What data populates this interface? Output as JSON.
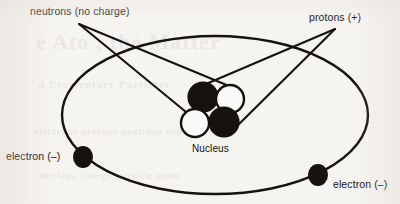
{
  "diagram": {
    "labels": {
      "neutrons": "neutrons (no charge)",
      "protons": "protons (+)",
      "electron_left": "electron (–)",
      "electron_right": "electron (–)",
      "nucleus": "Nucleus"
    },
    "ghost_text": {
      "title": "e Ato  ,  the Matter",
      "subtitle": "d Erementary Partictes",
      "body": "electrons protons neutrons orbit",
      "body2": "nucleus charge particle atom"
    },
    "colors": {
      "background": "#f6f4f1",
      "ink": "#15120f",
      "proton_fill": "#15120f",
      "neutron_fill": "#fbfaf8",
      "electron_fill": "#15120f",
      "orbit_stroke": "#15120f"
    },
    "particles": {
      "protons": [
        {
          "name": "proton-1",
          "cx": 203,
          "cy": 97,
          "r": 14.5,
          "fill": "#15120f"
        },
        {
          "name": "proton-2",
          "cx": 224,
          "cy": 122,
          "r": 14.5,
          "fill": "#15120f"
        }
      ],
      "neutrons": [
        {
          "name": "neutron-1",
          "cx": 230,
          "cy": 99,
          "r": 14.0,
          "fill": "#fbfaf8"
        },
        {
          "name": "neutron-2",
          "cx": 195,
          "cy": 123,
          "r": 14.0,
          "fill": "#fbfaf8"
        }
      ],
      "electrons": [
        {
          "name": "electron-left",
          "cx": 83,
          "cy": 157,
          "rx": 10,
          "ry": 11
        },
        {
          "name": "electron-right",
          "cx": 318,
          "cy": 175,
          "rx": 10,
          "ry": 11
        }
      ]
    },
    "orbit": {
      "cx": 215,
      "cy": 115,
      "rx": 153,
      "ry": 79,
      "stroke_width": 2.4
    },
    "leaders": {
      "neutron_origin": {
        "x": 79,
        "y": 24
      },
      "proton_origin": {
        "x": 335,
        "y": 29
      }
    }
  }
}
